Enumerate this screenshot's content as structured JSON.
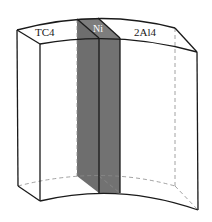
{
  "figure": {
    "type": "3d-schematic",
    "labels": {
      "left_material": "TC4",
      "interlayer": "Ni",
      "right_material": "2Al4"
    },
    "colors": {
      "background": "#ffffff",
      "outline": "#1a1a1a",
      "hidden_edge": "#8a8a8a",
      "interlayer_fill": "#6e6e6e",
      "interlayer_top": "#7d7d7d",
      "interlayer_label": "#ffffff"
    }
  }
}
